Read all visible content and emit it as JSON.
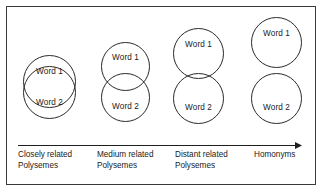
{
  "figure": {
    "border_color": "#3a3a3a",
    "circle_color": "#2a2a2a",
    "background": "#ffffff"
  },
  "axis": {
    "name": "semantic-relatedness-arrow",
    "direction": "left-to-right",
    "label": ""
  },
  "groups": [
    {
      "id": "closely-related-polysemes",
      "word1": "Word 1",
      "word2": "Word 2",
      "caption_line1": "Closely related",
      "caption_line2": "Polysemes",
      "overlap": "large"
    },
    {
      "id": "medium-related-polysemes",
      "word1": "Word 1",
      "word2": "Word 2",
      "caption_line1": "Medium related",
      "caption_line2": "Polysemes",
      "overlap": "medium"
    },
    {
      "id": "distant-related-polysemes",
      "word1": "Word 1",
      "word2": "Word 2",
      "caption_line1": "Distant related",
      "caption_line2": "Polysemes",
      "overlap": "slight"
    },
    {
      "id": "homonyms",
      "word1": "Word 1",
      "word2": "Word 2",
      "caption_line1": "Homonyms",
      "caption_line2": "",
      "overlap": "none"
    }
  ]
}
